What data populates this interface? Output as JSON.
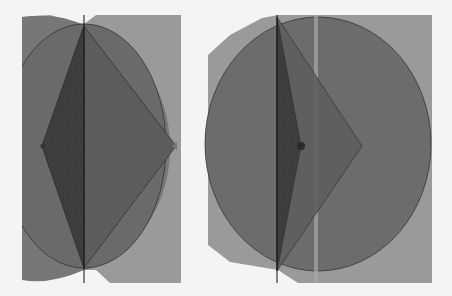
{
  "figure": {
    "panels": [
      {
        "id": "left",
        "rect": {
          "x": 22,
          "y": 15,
          "w": 159,
          "h": 268
        },
        "shapes": [
          "outer-rectangle",
          "large-circle",
          "outer-diamond",
          "inner-diamond",
          "vertical-axis"
        ]
      },
      {
        "id": "right",
        "rect": {
          "x": 208,
          "y": 15,
          "w": 224,
          "h": 268
        },
        "shapes": [
          "outer-rectangle",
          "large-circle",
          "outer-diamond",
          "inner-diamond",
          "vertical-axis",
          "vertical-highlight-strip"
        ]
      }
    ],
    "colors": {
      "background": "#f4f4f4",
      "rect_fill": "#9a9a9a",
      "circle_fill": "#6e6e6e",
      "diamond_fill": "#5a5a5a",
      "inner_fill": "#3e3e3e",
      "stroke": "#222222",
      "highlight": "#c8c8c8"
    }
  }
}
